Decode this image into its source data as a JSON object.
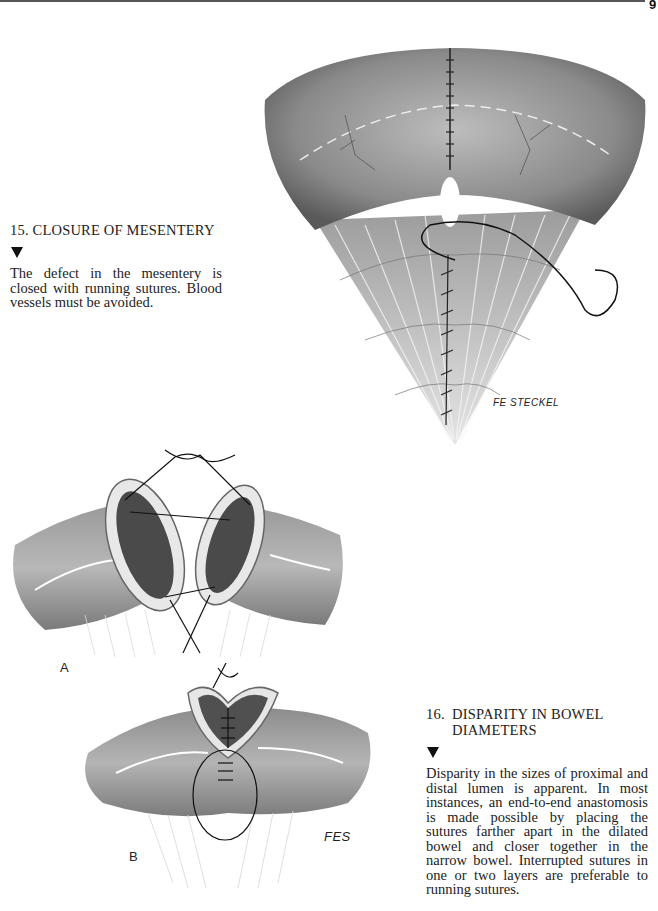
{
  "page": {
    "page_number": "9",
    "sections": [
      {
        "number": "15.",
        "title": "CLOSURE OF MESENTERY",
        "body": "The defect in the mesentery is closed with running sutures. Blood vessels must be avoided."
      },
      {
        "number": "16.",
        "title_line1": "DISPARITY IN BOWEL",
        "title_line2": "DIAMETERS",
        "body": "Disparity in the sizes of proximal and distal lumen is apparent. In most instances, an end-to-end anastomosis is made possible by placing the sutures farther apart in the dilated bowel and closer together in the narrow bowel. Interrupted sutures in one or two layers are preferable to running sutures."
      }
    ],
    "figures": {
      "fig15_signature": "FE STECKEL",
      "fig16a_label": "A",
      "fig16b_label": "B",
      "fig16b_signature": "FES"
    }
  }
}
